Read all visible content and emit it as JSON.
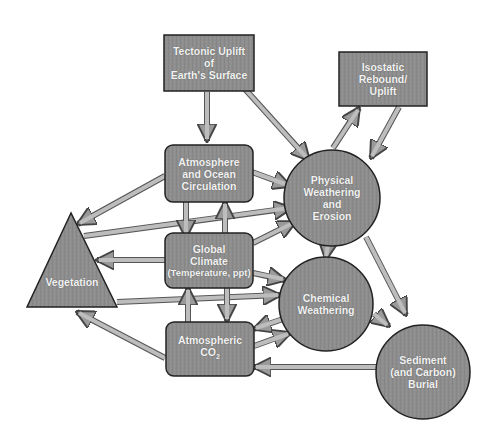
{
  "diagram": {
    "type": "flow-diagram",
    "colors": {
      "node_fill": "#8c8c8c",
      "node_stroke": "#222222",
      "arrow_fill": "#b0b0b0",
      "arrow_stroke": "#555555",
      "label_text": "#f2f2f2"
    },
    "nodes": {
      "tectonic": {
        "shape": "rectangle",
        "label": "Tectonic Uplift\nof\nEarth's Surface"
      },
      "isostatic": {
        "shape": "rectangle",
        "label": "Isostatic\nRebound/\nUplift"
      },
      "atmosphere": {
        "shape": "rounded-rectangle",
        "label": "Atmosphere\nand Ocean\nCirculation"
      },
      "climate": {
        "shape": "rounded-rectangle",
        "label_main": "Global\nClimate",
        "label_sub": "(Temperature, ppt)"
      },
      "co2": {
        "shape": "rounded-rectangle",
        "label_main": "Atmospheric",
        "label_co": "CO",
        "label_sub2": "2"
      },
      "vegetation": {
        "shape": "triangle",
        "label": "Vegetation"
      },
      "physical": {
        "shape": "circle",
        "label": "Physical\nWeathering\nand\nErosion"
      },
      "chemical": {
        "shape": "circle",
        "label": "Chemical\nWeathering"
      },
      "sediment": {
        "shape": "circle",
        "label": "Sediment\n(and Carbon)\nBurial"
      }
    },
    "edges": [
      {
        "from": "Tectonic Uplift of Earth's Surface",
        "to": "Atmosphere and Ocean Circulation"
      },
      {
        "from": "Tectonic Uplift of Earth's Surface",
        "to": "Physical Weathering and Erosion"
      },
      {
        "from": "Physical Weathering and Erosion",
        "to": "Isostatic Rebound/Uplift"
      },
      {
        "from": "Isostatic Rebound/Uplift",
        "to": "Physical Weathering and Erosion"
      },
      {
        "from": "Atmosphere and Ocean Circulation",
        "to": "Physical Weathering and Erosion"
      },
      {
        "from": "Atmosphere and Ocean Circulation",
        "to": "Vegetation"
      },
      {
        "from": "Atmosphere and Ocean Circulation",
        "to": "Global Climate"
      },
      {
        "from": "Global Climate",
        "to": "Atmosphere and Ocean Circulation"
      },
      {
        "from": "Vegetation",
        "to": "Physical Weathering and Erosion"
      },
      {
        "from": "Global Climate",
        "to": "Vegetation"
      },
      {
        "from": "Global Climate",
        "to": "Physical Weathering and Erosion"
      },
      {
        "from": "Global Climate",
        "to": "Chemical Weathering"
      },
      {
        "from": "Vegetation",
        "to": "Chemical Weathering"
      },
      {
        "from": "Atmospheric CO2",
        "to": "Global Climate"
      },
      {
        "from": "Global Climate",
        "to": "Atmospheric CO2"
      },
      {
        "from": "Atmospheric CO2",
        "to": "Vegetation"
      },
      {
        "from": "Chemical Weathering",
        "to": "Atmospheric CO2"
      },
      {
        "from": "Atmospheric CO2",
        "to": "Chemical Weathering"
      },
      {
        "from": "Sediment (and Carbon) Burial",
        "to": "Atmospheric CO2"
      },
      {
        "from": "Physical Weathering and Erosion",
        "to": "Chemical Weathering"
      },
      {
        "from": "Physical Weathering and Erosion",
        "to": "Sediment (and Carbon) Burial"
      },
      {
        "from": "Chemical Weathering",
        "to": "Sediment (and Carbon) Burial"
      }
    ]
  }
}
